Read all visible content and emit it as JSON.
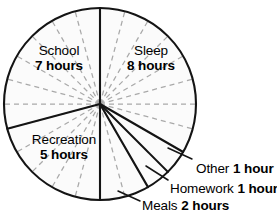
{
  "chart_data": {
    "type": "pie",
    "title": "",
    "subtitle": "",
    "xlabel": "",
    "ylabel": "",
    "unit": "hours",
    "total": 24,
    "grid": true,
    "grid_description": "24 dashed gray hour spokes, one every 15 degrees",
    "legend_position": "none",
    "start_angle_deg": 0,
    "direction": "clockwise",
    "categories": [
      "Sleep",
      "Other",
      "Homework",
      "Meals",
      "Recreation",
      "School"
    ],
    "values": [
      8,
      1,
      1,
      2,
      5,
      7
    ],
    "slices": [
      {
        "name": "Sleep",
        "value": 8,
        "unit": "hours",
        "label_name": "Sleep",
        "label_value": "8 hours",
        "start_deg": 0,
        "end_deg": 120,
        "label_placement": "inside"
      },
      {
        "name": "Other",
        "value": 1,
        "unit": "hour",
        "label_name": "Other",
        "label_value": "1 hour",
        "start_deg": 120,
        "end_deg": 135,
        "label_placement": "callout"
      },
      {
        "name": "Homework",
        "value": 1,
        "unit": "hour",
        "label_name": "Homework",
        "label_value": "1 hour",
        "start_deg": 135,
        "end_deg": 150,
        "label_placement": "callout"
      },
      {
        "name": "Meals",
        "value": 2,
        "unit": "hours",
        "label_name": "Meals",
        "label_value": "2 hours",
        "start_deg": 150,
        "end_deg": 180,
        "label_placement": "callout"
      },
      {
        "name": "Recreation",
        "value": 5,
        "unit": "hours",
        "label_name": "Recreation",
        "label_value": "5 hours",
        "start_deg": 180,
        "end_deg": 255,
        "label_placement": "inside"
      },
      {
        "name": "School",
        "value": 7,
        "unit": "hours",
        "label_name": "School",
        "label_value": "7 hours",
        "start_deg": 255,
        "end_deg": 360,
        "label_placement": "inside"
      }
    ],
    "colors": {
      "slice_fill": "#fbfbfb",
      "outline": "#141414",
      "divider": "#141414",
      "hour_spoke": "#a9a9a9",
      "text": "#000000",
      "background": "#ffffff"
    }
  }
}
